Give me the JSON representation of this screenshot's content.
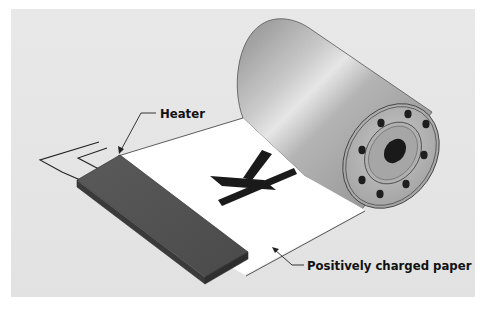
{
  "figure": {
    "background_color": "#e6e6e6",
    "paper_color": "#ffffff",
    "heater_color": "#4a4a4a",
    "drum_color": "#a8a8a8",
    "printed_character": "K"
  },
  "labels": {
    "heater": "Heater",
    "paper": "Positively charged paper"
  },
  "components": [
    {
      "id": "heater",
      "name": "Heater",
      "shape": "flat rectangular bar with two lead wires"
    },
    {
      "id": "paper",
      "name": "Positively charged paper",
      "shape": "sheet unrolling from drum"
    },
    {
      "id": "drum",
      "name": "Paper roll / drum",
      "shape": "cylinder with bolted end flange, 8 hex bolts and a central hub"
    }
  ]
}
